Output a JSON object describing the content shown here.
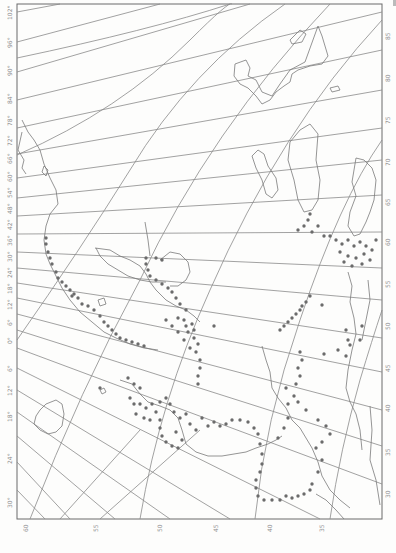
{
  "map": {
    "type": "scanned historical map, polar projection, rotated 90 degrees",
    "background": "#fdfdfc",
    "line_color": "#8a8a8a",
    "dot_color": "#6b6b6b",
    "left_axis_labels": [
      "102°",
      "96°",
      "90°",
      "84°",
      "78°",
      "72°",
      "66°",
      "60°",
      "54°",
      "48°",
      "42°",
      "36°",
      "30°",
      "24°",
      "18°",
      "12°",
      "6°",
      "0°",
      "6°",
      "12°",
      "18°",
      "24°",
      "30°"
    ],
    "bottom_axis_labels": [
      "60",
      "55",
      "50",
      "45",
      "40",
      "35"
    ],
    "right_axis_labels": [
      "85",
      "80",
      "75",
      "70",
      "65",
      "60",
      "55",
      "50",
      "45",
      "40",
      "35",
      "30"
    ],
    "frame": {
      "left": 17,
      "top": 4,
      "right": 382,
      "bottom": 519
    },
    "legend": null
  }
}
